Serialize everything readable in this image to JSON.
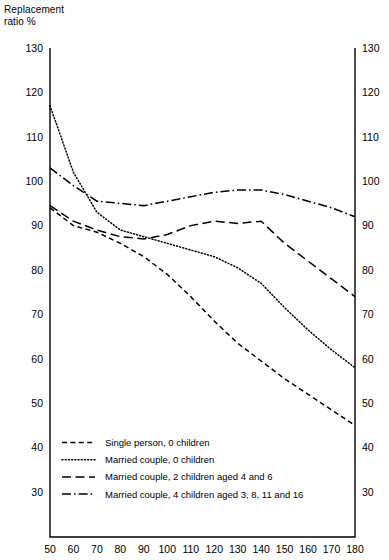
{
  "chart_data": {
    "type": "line",
    "title": "",
    "ylabel": "Replacement\nratio %",
    "xlabel": "",
    "xlim": [
      50,
      180
    ],
    "ylim": [
      30,
      130
    ],
    "grid": false,
    "legend_position": "bottom-left-inside",
    "x_ticks": [
      50,
      60,
      70,
      80,
      90,
      100,
      110,
      120,
      130,
      140,
      150,
      160,
      170,
      180
    ],
    "y_ticks": [
      30,
      40,
      50,
      60,
      70,
      80,
      90,
      100,
      110,
      120,
      130
    ],
    "y_ticks_right": [
      30,
      40,
      50,
      60,
      70,
      80,
      90,
      100,
      110,
      120,
      130
    ],
    "x": [
      50,
      60,
      70,
      80,
      90,
      100,
      110,
      120,
      130,
      140,
      150,
      160,
      170,
      180
    ],
    "series": [
      {
        "name": "Single person, 0 children",
        "style": "short-dash",
        "values": [
          94,
          90,
          88.5,
          86,
          83,
          79,
          74,
          68.5,
          63.5,
          59.5,
          55.5,
          52,
          48.5,
          45
        ]
      },
      {
        "name": "Married couple, 0 children",
        "style": "dotted",
        "values": [
          117,
          102,
          93,
          89,
          87.5,
          86,
          84.5,
          83,
          80.5,
          77,
          71.5,
          66.5,
          62,
          58
        ]
      },
      {
        "name": "Married couple, 2 children aged 4 and 6",
        "style": "long-dash",
        "values": [
          94.5,
          91,
          89,
          87.5,
          87,
          88,
          90,
          91,
          90.5,
          91,
          86,
          82,
          78,
          74
        ]
      },
      {
        "name": "Married couple, 4 children aged 3, 8, 11 and 16",
        "style": "dash-dot",
        "values": [
          103,
          99,
          95.5,
          95,
          94.5,
          95.5,
          96.5,
          97.5,
          98,
          98,
          97,
          95.5,
          94,
          92
        ]
      }
    ]
  },
  "legend": {
    "items": [
      {
        "label": "Single person, 0 children",
        "style": "short-dash"
      },
      {
        "label": "Married couple, 0 children",
        "style": "dotted"
      },
      {
        "label": "Married couple, 2 children aged 4 and 6",
        "style": "long-dash"
      },
      {
        "label": "Married couple, 4 children aged 3, 8, 11 and 16",
        "style": "dash-dot"
      }
    ]
  }
}
